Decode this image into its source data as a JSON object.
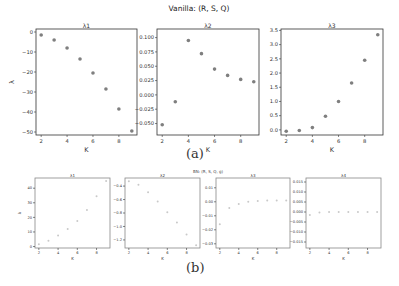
{
  "figure": {
    "caption_a": "(a)",
    "caption_b": "(b)",
    "title_a": "Vanilla: (R, S, Q)",
    "title_b": "BN: (R, S, Q, g)"
  },
  "chart_data": [
    {
      "type": "scatter",
      "group": "Vanilla: (R, S, Q)",
      "title": "λ1",
      "xlabel": "K",
      "ylabel": "λ",
      "x": [
        2,
        3,
        4,
        5,
        6,
        7,
        8,
        9
      ],
      "values": [
        -1.5,
        -4,
        -8,
        -13.5,
        -20.5,
        -28.5,
        -38.5,
        -49.5
      ],
      "xticks": [
        2,
        4,
        6,
        8
      ],
      "yticks": [
        0,
        -10,
        -20,
        -30,
        -40,
        -50
      ],
      "ylim": [
        -51.5,
        1.5
      ],
      "xlim": [
        1.6,
        9.4
      ],
      "frame": [
        36,
        29,
        137,
        135
      ]
    },
    {
      "type": "scatter",
      "group": "Vanilla: (R, S, Q)",
      "title": "λ2",
      "xlabel": "K",
      "ylabel": "",
      "x": [
        2,
        3,
        4,
        5,
        6,
        7,
        8,
        9
      ],
      "values": [
        -0.052,
        -0.012,
        0.095,
        0.072,
        0.045,
        0.034,
        0.027,
        0.023
      ],
      "xticks": [
        2,
        4,
        6,
        8
      ],
      "yticks": [
        0.1,
        0.075,
        0.05,
        0.025,
        0.0,
        -0.025,
        -0.05
      ],
      "ytick_labels": [
        "0.100",
        "0.075",
        "0.050",
        "0.025",
        "0.000",
        "−0.025",
        "−0.050"
      ],
      "ylim": [
        -0.07,
        0.115
      ],
      "xlim": [
        1.6,
        9.4
      ],
      "frame": [
        157,
        29,
        259,
        135
      ]
    },
    {
      "type": "scatter",
      "group": "Vanilla: (R, S, Q)",
      "title": "λ3",
      "xlabel": "K",
      "ylabel": "",
      "x": [
        2,
        3,
        4,
        5,
        6,
        7,
        8,
        9
      ],
      "values": [
        -0.05,
        -0.02,
        0.08,
        0.48,
        1.0,
        1.65,
        2.45,
        3.35
      ],
      "xticks": [
        2,
        4,
        6,
        8
      ],
      "yticks": [
        0.0,
        0.5,
        1.0,
        1.5,
        2.0,
        2.5,
        3.0,
        3.5
      ],
      "ytick_labels": [
        "0.0",
        "0.5",
        "1.0",
        "1.5",
        "2.0",
        "2.5",
        "3.0",
        "3.5"
      ],
      "ylim": [
        -0.18,
        3.55
      ],
      "xlim": [
        1.6,
        9.4
      ],
      "frame": [
        281,
        29,
        383,
        135
      ]
    },
    {
      "type": "scatter",
      "group": "BN: (R, S, Q, g)",
      "title": "λ1",
      "xlabel": "K",
      "ylabel": "λ",
      "x": [
        2,
        3,
        4,
        5,
        6,
        7,
        8,
        9
      ],
      "values": [
        1.5,
        4,
        7.5,
        12,
        17.5,
        25,
        34.5,
        45
      ],
      "xticks": [
        2,
        4,
        6,
        8
      ],
      "yticks": [
        0,
        10,
        20,
        30,
        40
      ],
      "ylim": [
        -1,
        47
      ],
      "xlim": [
        1.6,
        9.4
      ],
      "frame": [
        35,
        178,
        110,
        248
      ]
    },
    {
      "type": "scatter",
      "group": "BN: (R, S, Q, g)",
      "title": "λ2",
      "xlabel": "K",
      "ylabel": "",
      "x": [
        2,
        3,
        4,
        5,
        6,
        7,
        8,
        9
      ],
      "values": [
        -0.33,
        -0.38,
        -0.49,
        -0.63,
        -0.79,
        -0.94,
        -1.12,
        -1.28
      ],
      "xticks": [
        2,
        4,
        6,
        8
      ],
      "yticks": [
        -0.4,
        -0.6,
        -0.8,
        -1.0,
        -1.2
      ],
      "ytick_labels": [
        "−0.4",
        "−0.6",
        "−0.8",
        "−1.0",
        "−1.2"
      ],
      "ylim": [
        -1.32,
        -0.28
      ],
      "xlim": [
        1.6,
        9.4
      ],
      "frame": [
        125,
        178,
        200,
        248
      ]
    },
    {
      "type": "scatter",
      "group": "BN: (R, S, Q, g)",
      "title": "λ3",
      "xlabel": "K",
      "ylabel": "",
      "x": [
        2,
        3,
        4,
        5,
        6,
        7,
        8,
        9
      ],
      "values": [
        -0.016,
        -0.0045,
        -0.0015,
        0.0,
        0.0005,
        0.001,
        0.001,
        0.001
      ],
      "xticks": [
        2,
        4,
        6,
        8
      ],
      "yticks": [
        0.01,
        0.0,
        -0.01,
        -0.02,
        -0.03
      ],
      "ytick_labels": [
        "0.01",
        "0.00",
        "−0.01",
        "−0.02",
        "−0.03"
      ],
      "ylim": [
        -0.033,
        0.017
      ],
      "xlim": [
        1.6,
        9.4
      ],
      "frame": [
        216,
        178,
        290,
        248
      ]
    },
    {
      "type": "scatter",
      "group": "BN: (R, S, Q, g)",
      "title": "λ4",
      "xlabel": "K",
      "ylabel": "",
      "x": [
        2,
        3,
        4,
        5,
        6,
        7,
        8,
        9
      ],
      "values": [
        -0.0015,
        -0.0002,
        0,
        0,
        0,
        0,
        0,
        0
      ],
      "xticks": [
        2,
        4,
        6,
        8
      ],
      "yticks": [
        0.015,
        0.01,
        0.005,
        0.0,
        -0.005,
        -0.01,
        -0.015
      ],
      "ytick_labels": [
        "0.015",
        "0.010",
        "0.005",
        "0.000",
        "−0.005",
        "−0.010",
        "−0.015"
      ],
      "ylim": [
        -0.018,
        0.017
      ],
      "xlim": [
        1.6,
        9.4
      ],
      "frame": [
        306,
        178,
        381,
        248
      ]
    }
  ]
}
